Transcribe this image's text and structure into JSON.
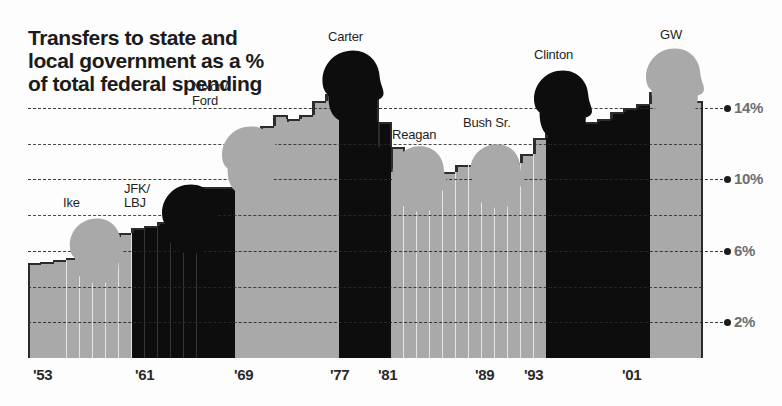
{
  "title": "Transfers to state and local government as a % of total federal spending",
  "axis": {
    "y_labels": [
      "14%",
      "10%",
      "6%",
      "2%"
    ],
    "y_gridlines": [
      14,
      12,
      10,
      8,
      6,
      4,
      2
    ],
    "x_labels": [
      "'53",
      "'61",
      "'69",
      "'77",
      "'81",
      "'89",
      "'93",
      "'01"
    ]
  },
  "colors": {
    "republican": "#a9a9a9",
    "democrat": "#0d0d0d",
    "grid": "#2b2b2b",
    "ylabel": "#6e6e6e",
    "text": "#1f1f1f"
  },
  "presidents": [
    {
      "name": "Ike",
      "party": "republican"
    },
    {
      "name": "JFK/\nLBJ",
      "party": "democrat"
    },
    {
      "name": "Nixon/\nFord",
      "party": "republican"
    },
    {
      "name": "Carter",
      "party": "democrat"
    },
    {
      "name": "Reagan",
      "party": "republican"
    },
    {
      "name": "Bush Sr.",
      "party": "republican"
    },
    {
      "name": "Clinton",
      "party": "democrat"
    },
    {
      "name": "GW",
      "party": "republican"
    }
  ],
  "chart_data": {
    "type": "bar",
    "title": "Transfers to state and local government as a % of total federal spending",
    "xlabel": "",
    "ylabel": "% of total federal spending",
    "ylim": [
      0,
      16
    ],
    "grid": true,
    "legend": "none",
    "categories": [
      "1953",
      "1954",
      "1955",
      "1956",
      "1957",
      "1958",
      "1959",
      "1960",
      "1961",
      "1962",
      "1963",
      "1964",
      "1965",
      "1966",
      "1967",
      "1968",
      "1969",
      "1970",
      "1971",
      "1972",
      "1973",
      "1974",
      "1975",
      "1976",
      "1977",
      "1978",
      "1979",
      "1980",
      "1981",
      "1982",
      "1983",
      "1984",
      "1985",
      "1986",
      "1987",
      "1988",
      "1989",
      "1990",
      "1991",
      "1992",
      "1993",
      "1994",
      "1995",
      "1996",
      "1997",
      "1998",
      "1999",
      "2000",
      "2001",
      "2002",
      "2003",
      "2004"
    ],
    "values": [
      5.3,
      5.4,
      5.5,
      5.6,
      5.8,
      6.4,
      6.8,
      7.0,
      7.3,
      7.4,
      7.6,
      8.2,
      9.2,
      9.6,
      9.6,
      9.6,
      11.0,
      12.2,
      13.0,
      13.6,
      13.4,
      13.6,
      14.4,
      14.8,
      14.9,
      15.4,
      14.6,
      13.2,
      11.8,
      10.7,
      10.6,
      10.5,
      10.4,
      10.8,
      10.8,
      10.8,
      10.6,
      10.9,
      11.4,
      12.3,
      12.6,
      12.8,
      13.1,
      13.2,
      13.4,
      13.8,
      14.0,
      14.2,
      14.9,
      15.3,
      14.8,
      14.4
    ],
    "colors_by_point": [
      "republican",
      "republican",
      "republican",
      "republican",
      "republican",
      "republican",
      "republican",
      "republican",
      "democrat",
      "democrat",
      "democrat",
      "democrat",
      "democrat",
      "democrat",
      "democrat",
      "democrat",
      "republican",
      "republican",
      "republican",
      "republican",
      "republican",
      "republican",
      "republican",
      "republican",
      "democrat",
      "democrat",
      "democrat",
      "democrat",
      "republican",
      "republican",
      "republican",
      "republican",
      "republican",
      "republican",
      "republican",
      "republican",
      "republican",
      "republican",
      "republican",
      "republican",
      "democrat",
      "democrat",
      "democrat",
      "democrat",
      "democrat",
      "democrat",
      "democrat",
      "democrat",
      "republican",
      "republican",
      "republican",
      "republican"
    ]
  }
}
